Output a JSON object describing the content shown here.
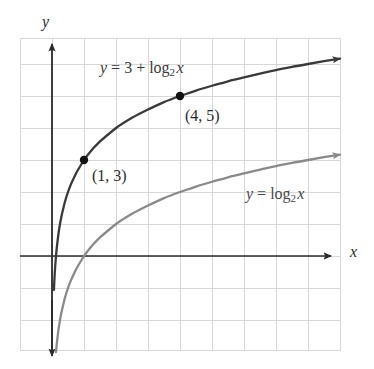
{
  "figure": {
    "name": "logarithmic-function-graph",
    "background_color": "#ffffff"
  },
  "axes": {
    "x_label": "x",
    "y_label": "y",
    "x_axis_color": "#2b2b2b",
    "y_axis_color": "#2b2b2b",
    "grid_color": "#d8d8dc",
    "grid_visible": true,
    "x_axis_pixel_y": 256,
    "y_axis_pixel_x": 52,
    "unit_pixels": 32,
    "grid_left": 20,
    "grid_top": 38,
    "grid_right": 340,
    "grid_bottom": 350
  },
  "labels": {
    "upper_curve": {
      "lhs": "y",
      "eq": " = 3 + log",
      "base": "2",
      "arg": "x",
      "color": "#4a4a4a"
    },
    "lower_curve": {
      "lhs": "y",
      "eq": " = log",
      "base": "2",
      "arg": "x",
      "color": "#6e6e6e"
    },
    "point_13": "(1, 3)",
    "point_45": "(4, 5)",
    "axis_x": "x",
    "axis_y": "y"
  },
  "chart_data": {
    "type": "line",
    "title": "",
    "xlabel": "x",
    "ylabel": "y",
    "grid": true,
    "legend_position": "inline-annotations",
    "xlim": [
      -1,
      9
    ],
    "ylim": [
      -2.75,
      6.8
    ],
    "xticks": [
      -1,
      0,
      1,
      2,
      3,
      4,
      5,
      6,
      7,
      8,
      9
    ],
    "yticks": [
      -2,
      -1,
      0,
      1,
      2,
      3,
      4,
      5,
      6
    ],
    "tick_labels_shown": false,
    "series": [
      {
        "name": "y = 3 + log_2 x",
        "color": "#3a3a3a",
        "width": 2.2,
        "arrow_end": true,
        "formula": "3 + log2(x)",
        "x": [
          0.06,
          0.08,
          0.1,
          0.125,
          0.15,
          0.2,
          0.25,
          0.3,
          0.4,
          0.5,
          0.6,
          0.75,
          1,
          1.25,
          1.5,
          2,
          2.5,
          3,
          3.5,
          4,
          4.5,
          5,
          5.5,
          6,
          6.5,
          7,
          7.5,
          8,
          8.5,
          9
        ],
        "y": [
          -1.06,
          -0.64,
          -0.32,
          0.0,
          0.26,
          0.68,
          1.0,
          1.26,
          1.68,
          2.0,
          2.26,
          2.58,
          3.0,
          3.32,
          3.58,
          4.0,
          4.32,
          4.58,
          4.81,
          5.0,
          5.17,
          5.32,
          5.46,
          5.58,
          5.7,
          5.81,
          5.91,
          6.0,
          6.09,
          6.17
        ]
      },
      {
        "name": "y = log_2 x",
        "color": "#8a8a8a",
        "width": 2.2,
        "arrow_end": true,
        "formula": "log2(x)",
        "x": [
          0.06,
          0.08,
          0.1,
          0.125,
          0.15,
          0.2,
          0.25,
          0.3,
          0.4,
          0.5,
          0.6,
          0.75,
          1,
          1.25,
          1.5,
          2,
          2.5,
          3,
          3.5,
          4,
          4.5,
          5,
          5.5,
          6,
          6.5,
          7,
          7.5,
          8,
          8.5,
          9
        ],
        "y": [
          -4.06,
          -3.64,
          -3.32,
          -3.0,
          -2.74,
          -2.32,
          -2.0,
          -1.74,
          -1.32,
          -1.0,
          -0.74,
          -0.42,
          0.0,
          0.32,
          0.58,
          1.0,
          1.32,
          1.58,
          1.81,
          2.0,
          2.17,
          2.32,
          2.46,
          2.58,
          2.7,
          2.81,
          2.91,
          3.0,
          3.09,
          3.17
        ]
      }
    ],
    "points": [
      {
        "label": "(1, 3)",
        "x": 1,
        "y": 3,
        "series": "y = 3 + log_2 x",
        "color": "#111111"
      },
      {
        "label": "(4, 5)",
        "x": 4,
        "y": 5,
        "series": "y = 3 + log_2 x",
        "color": "#111111"
      }
    ],
    "annotations": [
      {
        "text": "y = 3 + log2 x",
        "x_pixel": 100,
        "y_pixel": 60
      },
      {
        "text": "y = log2 x",
        "x_pixel": 246,
        "y_pixel": 186
      },
      {
        "text": "(1, 3)",
        "x_pixel": 92,
        "y_pixel": 168
      },
      {
        "text": "(4, 5)",
        "x_pixel": 185,
        "y_pixel": 108
      }
    ]
  }
}
